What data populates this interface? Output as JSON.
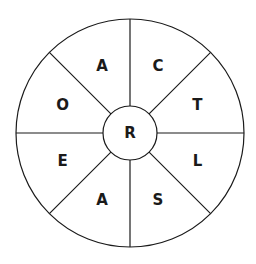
{
  "puzzle": {
    "center_letter": "R",
    "segments": [
      {
        "letter": "C"
      },
      {
        "letter": "T"
      },
      {
        "letter": "L"
      },
      {
        "letter": "S"
      },
      {
        "letter": "A"
      },
      {
        "letter": "E"
      },
      {
        "letter": "O"
      },
      {
        "letter": "A"
      }
    ]
  }
}
